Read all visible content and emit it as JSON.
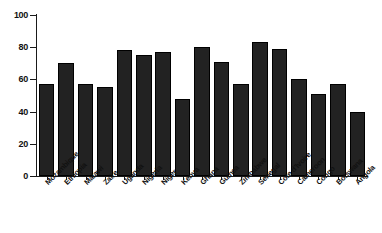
{
  "chart_data": {
    "type": "bar",
    "title": "",
    "subtitle": "",
    "xlabel": "",
    "ylabel": "",
    "ylim": [
      0,
      100
    ],
    "yticks": [
      0,
      20,
      40,
      60,
      80,
      100
    ],
    "grid": false,
    "legend": null,
    "bar_color": "#222222",
    "axis_color": "#1a1a1a",
    "categories": [
      "Mozambique",
      "Ethiopia",
      "Malawi",
      "Zaire",
      "Uganda",
      "Nigeria",
      "Niger",
      "Kenya",
      "Ghana",
      "Guinea",
      "Zimbabwe",
      "Senegal",
      "Cote d'Ivoire",
      "Cameroon",
      "Congo",
      "Botswana",
      "Angola"
    ],
    "values": [
      57,
      70,
      57,
      55,
      78,
      75,
      77,
      48,
      80,
      71,
      57,
      83,
      79,
      60,
      51,
      57,
      40
    ]
  }
}
